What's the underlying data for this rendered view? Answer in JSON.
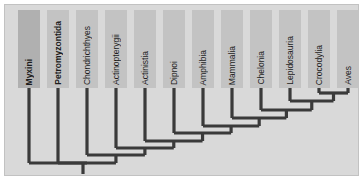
{
  "figure": {
    "type": "cladogram",
    "title": "",
    "background_color": "#d9d9d9",
    "line_color": "#3a3a3a",
    "box_color": "#c3c3c3",
    "box_color_highlight": "#b0b0b0",
    "border_color": "#c2c2c2"
  },
  "taxa": [
    {
      "label": "Myxini",
      "bold": true,
      "box_x": 18,
      "highlight": true
    },
    {
      "label": "Petromyzontida",
      "bold": true,
      "box_x": 47,
      "highlight": false
    },
    {
      "label": "Chondrichthyes",
      "bold": false,
      "box_x": 76,
      "highlight": false
    },
    {
      "label": "Actinopterygii",
      "bold": false,
      "box_x": 105,
      "highlight": false
    },
    {
      "label": "Actinistia",
      "bold": false,
      "box_x": 134,
      "highlight": false
    },
    {
      "label": "Dipnoi",
      "bold": false,
      "box_x": 163,
      "highlight": false
    },
    {
      "label": "Amphibia",
      "bold": false,
      "box_x": 192,
      "highlight": false
    },
    {
      "label": "Mammalia",
      "bold": false,
      "box_x": 221,
      "highlight": false
    },
    {
      "label": "Chelonia",
      "bold": false,
      "box_x": 250,
      "highlight": false
    },
    {
      "label": "Lepidosauria",
      "bold": false,
      "box_x": 279,
      "highlight": false
    },
    {
      "label": "Crocodylia",
      "bold": false,
      "box_x": 308,
      "highlight": false
    },
    {
      "label": "Aves",
      "bold": false,
      "box_x": 337,
      "highlight": false
    }
  ],
  "chart_data": {
    "type": "tree",
    "leaf_order": [
      "Myxini",
      "Petromyzontida",
      "Chondrichthyes",
      "Actinopterygii",
      "Actinistia",
      "Dipnoi",
      "Amphibia",
      "Mammalia",
      "Chelonia",
      "Lepidosauria",
      "Crocodylia",
      "Aves"
    ],
    "topology": "(Myxini,(Petromyzontida,(Chondrichthyes,(Actinopterygii,(Actinistia,(Dipnoi,(Amphibia,(Mammalia,(Chelonia,(Lepidosauria,(Crocodylia,Aves)))))))))))",
    "nodes": [
      {
        "name": "crocodylia-aves-node",
        "children": [
          "Crocodylia",
          "Aves"
        ],
        "y": 93
      },
      {
        "name": "archosauria-lepido-node",
        "children": [
          "Lepidosauria",
          "croc-aves"
        ],
        "y": 101
      },
      {
        "name": "reptilia-node",
        "children": [
          "Chelonia",
          "lepido-archo"
        ],
        "y": 110
      },
      {
        "name": "amniota-node",
        "children": [
          "Mammalia",
          "reptilia"
        ],
        "y": 118
      },
      {
        "name": "tetrapoda-node",
        "children": [
          "Amphibia",
          "amniota"
        ],
        "y": 126
      },
      {
        "name": "rhipidistia-node",
        "children": [
          "Dipnoi",
          "tetrapoda"
        ],
        "y": 133
      },
      {
        "name": "sarcopterygii-node",
        "children": [
          "Actinistia",
          "rhipidistia"
        ],
        "y": 141
      },
      {
        "name": "osteichthyes-node",
        "children": [
          "Actinopterygii",
          "sarcopterygii"
        ],
        "y": 148
      },
      {
        "name": "gnathostomata-node",
        "children": [
          "Chondrichthyes",
          "osteichthyes"
        ],
        "y": 155
      },
      {
        "name": "vertebrata-node",
        "children": [
          "Petromyzontida",
          "gnathostomata"
        ],
        "y": 163
      },
      {
        "name": "craniata-root-node",
        "children": [
          "Myxini",
          "vertebrata"
        ],
        "y": 163
      }
    ],
    "root_stem": {
      "x": 83,
      "y_top": 163,
      "y_bottom": 174
    }
  }
}
